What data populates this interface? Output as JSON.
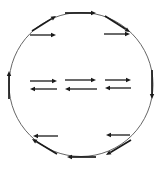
{
  "diagram": {
    "title": "",
    "colors": {
      "background": "#ffffff",
      "circle_stroke": "#555555",
      "arrow": "#1a1a1a"
    },
    "circle": {
      "cx": 81,
      "cy": 84.5,
      "r": 72
    },
    "boundary_arrows": [
      {
        "id": "top",
        "x1": 65,
        "y1": 13,
        "x2": 96,
        "y2": 13,
        "direction": "right"
      },
      {
        "id": "upper-left",
        "x1": 32,
        "y1": 31,
        "x2": 56,
        "y2": 16,
        "direction": "up-right"
      },
      {
        "id": "upper-right",
        "x1": 105,
        "y1": 16,
        "x2": 130,
        "y2": 32,
        "direction": "down-right"
      },
      {
        "id": "right",
        "x1": 152,
        "y1": 70,
        "x2": 152,
        "y2": 99,
        "direction": "down"
      },
      {
        "id": "lower-right",
        "x1": 131,
        "y1": 140,
        "x2": 106,
        "y2": 155,
        "direction": "down-left"
      },
      {
        "id": "bottom",
        "x1": 96,
        "y1": 157,
        "x2": 67,
        "y2": 157,
        "direction": "left"
      },
      {
        "id": "lower-left",
        "x1": 57,
        "y1": 154,
        "x2": 32,
        "y2": 139,
        "direction": "up-left"
      },
      {
        "id": "left",
        "x1": 9,
        "y1": 99,
        "x2": 9,
        "y2": 71,
        "direction": "up"
      }
    ],
    "interior_arrows": [
      {
        "id": "inner-upper-left",
        "x1": 30,
        "y1": 35,
        "x2": 56,
        "y2": 35,
        "direction": "right"
      },
      {
        "id": "inner-upper-right",
        "x1": 104,
        "y1": 34,
        "x2": 130,
        "y2": 34,
        "direction": "right"
      },
      {
        "id": "mid-left-right",
        "x1": 30,
        "y1": 81,
        "x2": 57,
        "y2": 81,
        "direction": "right"
      },
      {
        "id": "mid-center-right",
        "x1": 65,
        "y1": 80,
        "x2": 96,
        "y2": 80,
        "direction": "right"
      },
      {
        "id": "mid-right-right",
        "x1": 105,
        "y1": 80,
        "x2": 131,
        "y2": 80,
        "direction": "right"
      },
      {
        "id": "mid-left-left",
        "x1": 57,
        "y1": 89,
        "x2": 30,
        "y2": 89,
        "direction": "left"
      },
      {
        "id": "mid-center-left",
        "x1": 97,
        "y1": 89,
        "x2": 65,
        "y2": 89,
        "direction": "left"
      },
      {
        "id": "mid-right-left",
        "x1": 131,
        "y1": 88,
        "x2": 105,
        "y2": 88,
        "direction": "left"
      },
      {
        "id": "inner-lower-left",
        "x1": 58,
        "y1": 136,
        "x2": 33,
        "y2": 136,
        "direction": "left"
      },
      {
        "id": "inner-lower-right",
        "x1": 130,
        "y1": 135,
        "x2": 106,
        "y2": 135,
        "direction": "left"
      }
    ]
  }
}
